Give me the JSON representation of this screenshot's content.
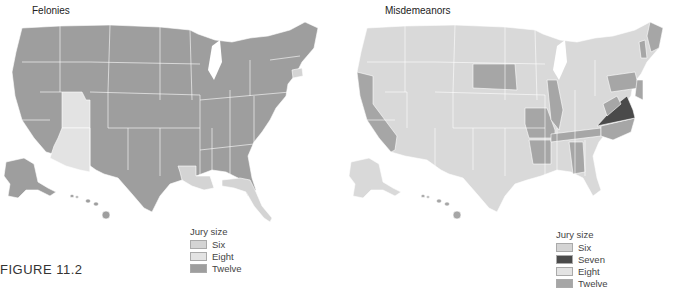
{
  "figure": {
    "caption": "FIGURE 11.2"
  },
  "colors": {
    "six": "#d9d9d9",
    "seven": "#4a4a4a",
    "eight": "#e6e6e6",
    "twelve": "#9e9e9e",
    "border": "#ffffff"
  },
  "maps": [
    {
      "title": "Felonies",
      "legend": {
        "title": "Jury size",
        "items": [
          {
            "label": "Six",
            "color": "#d4d4d4"
          },
          {
            "label": "Eight",
            "color": "#e3e3e3"
          },
          {
            "label": "Twelve",
            "color": "#9e9e9e"
          }
        ]
      },
      "states_by_jury_size": {
        "Six": [
          "Arizona",
          "Utah",
          "Connecticut",
          "Louisiana",
          "Florida"
        ],
        "Eight": [
          "Arizona",
          "Utah"
        ],
        "Twelve": [
          "all other states"
        ]
      }
    },
    {
      "title": "Misdemeanors",
      "legend": {
        "title": "Jury size",
        "items": [
          {
            "label": "Six",
            "color": "#d4d4d4"
          },
          {
            "label": "Seven",
            "color": "#4a4a4a"
          },
          {
            "label": "Eight",
            "color": "#e3e3e3"
          },
          {
            "label": "Twelve",
            "color": "#a6a6a6"
          }
        ]
      },
      "states_by_jury_size": {
        "Seven": [
          "Virginia"
        ],
        "Twelve": [
          "California",
          "South Dakota",
          "Missouri",
          "Illinois",
          "Arkansas",
          "Tennessee",
          "North Carolina",
          "Alabama",
          "Pennsylvania",
          "West Virginia",
          "New Jersey",
          "Maryland",
          "Delaware",
          "Vermont",
          "Maine",
          "Hawaii"
        ],
        "Six": [
          "most other states"
        ]
      }
    }
  ]
}
